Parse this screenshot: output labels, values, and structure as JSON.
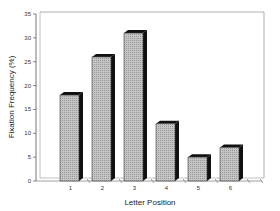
{
  "chart_data": {
    "type": "bar",
    "title": "",
    "xlabel": "Letter Position",
    "ylabel": "Fixation Frequency (%)",
    "categories": [
      "1",
      "2",
      "3",
      "4",
      "5",
      "6"
    ],
    "values": [
      18,
      26,
      31,
      12,
      5,
      7
    ],
    "ylim": [
      0,
      35
    ],
    "yticks": [
      0,
      5,
      10,
      15,
      20,
      25,
      30,
      35
    ],
    "grid": false,
    "legend": null,
    "style": {
      "bar_fill": "#b8b8b8",
      "bar_shadow": "#111111",
      "three_d": true
    }
  }
}
